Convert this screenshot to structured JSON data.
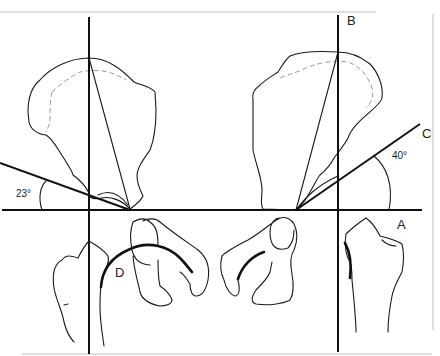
{
  "figure": {
    "type": "anatomical line diagram",
    "labels": {
      "A": "A",
      "B": "B",
      "C": "C",
      "D": "D"
    },
    "angles": {
      "left": "23°",
      "right": "40°"
    },
    "colors": {
      "line": "#111111",
      "background": "#ffffff",
      "frame": "#bdbdbd"
    }
  }
}
